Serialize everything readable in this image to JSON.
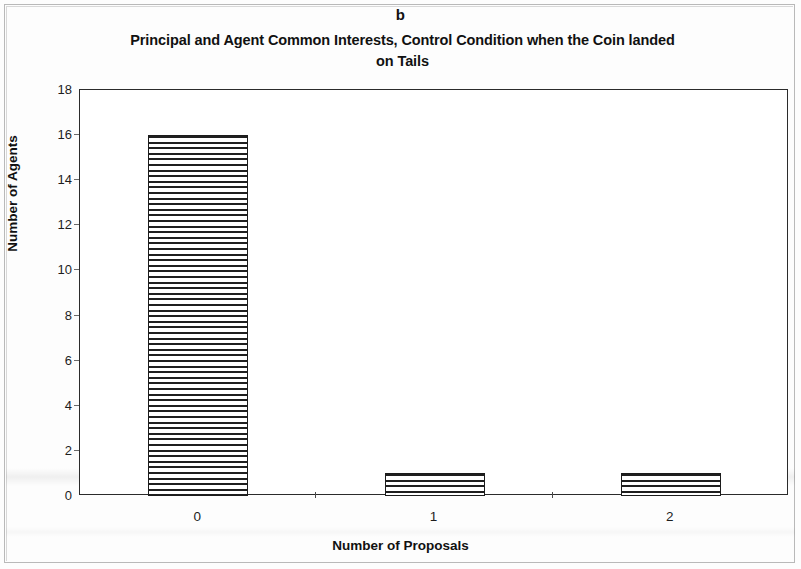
{
  "figure": {
    "panel_label": "b",
    "title_line_1": "Principal and Agent Common Interests, Control Condition when the Coin landed",
    "title_line_2": "on Tails"
  },
  "chart_data": {
    "type": "bar",
    "title": "Principal and Agent Common Interests, Control Condition when the Coin landed on Tails",
    "panel": "b",
    "categories": [
      "0",
      "1",
      "2"
    ],
    "values": [
      16,
      1,
      1
    ],
    "xlabel": "Number of Proposals",
    "ylabel": "Number of Agents",
    "ylim": [
      0,
      18
    ],
    "ytick_values": [
      0,
      2,
      4,
      6,
      8,
      10,
      12,
      14,
      16,
      18
    ],
    "ytick_labels": [
      "0",
      "2",
      "4",
      "6",
      "8",
      "10",
      "12",
      "14",
      "16",
      "18"
    ],
    "grid": false,
    "legend": null,
    "bar_fill": "horizontal-line-hatch",
    "bar_edge_color": "#1c1c1c",
    "bar_fill_color": "#1f1f1f"
  },
  "colors": {
    "frame": "#2b2b2b",
    "text": "#111111",
    "background": "#ffffff"
  }
}
